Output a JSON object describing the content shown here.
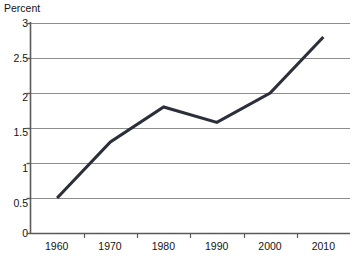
{
  "chart_data": {
    "type": "line",
    "title": "",
    "xlabel": "",
    "ylabel": "Percent",
    "categories": [
      "1960",
      "1970",
      "1980",
      "1990",
      "2000",
      "2010"
    ],
    "x": [
      1960,
      1970,
      1980,
      1990,
      2000,
      2010
    ],
    "values": [
      0.5,
      1.3,
      1.8,
      1.58,
      2.0,
      2.8
    ],
    "series": [
      {
        "name": "Percent",
        "values": [
          0.5,
          1.3,
          1.8,
          1.58,
          2.0,
          2.8
        ]
      }
    ],
    "ylim": [
      0,
      3
    ],
    "yticks": [
      "0",
      "0.5",
      "1",
      "1.5",
      "2",
      "2.5",
      "3"
    ],
    "ytick_values": [
      0,
      0.5,
      1,
      1.5,
      2,
      2.5,
      3
    ],
    "xticks": [
      "1960",
      "1970",
      "1980",
      "1990",
      "2000",
      "2010"
    ],
    "grid": "horizontal",
    "legend": "none",
    "line_color": "#2b2f39",
    "grid_color": "#8d8d8d",
    "axis_color": "#5a5a5a",
    "background_color": "#ffffff"
  },
  "axis_title": "Percent"
}
